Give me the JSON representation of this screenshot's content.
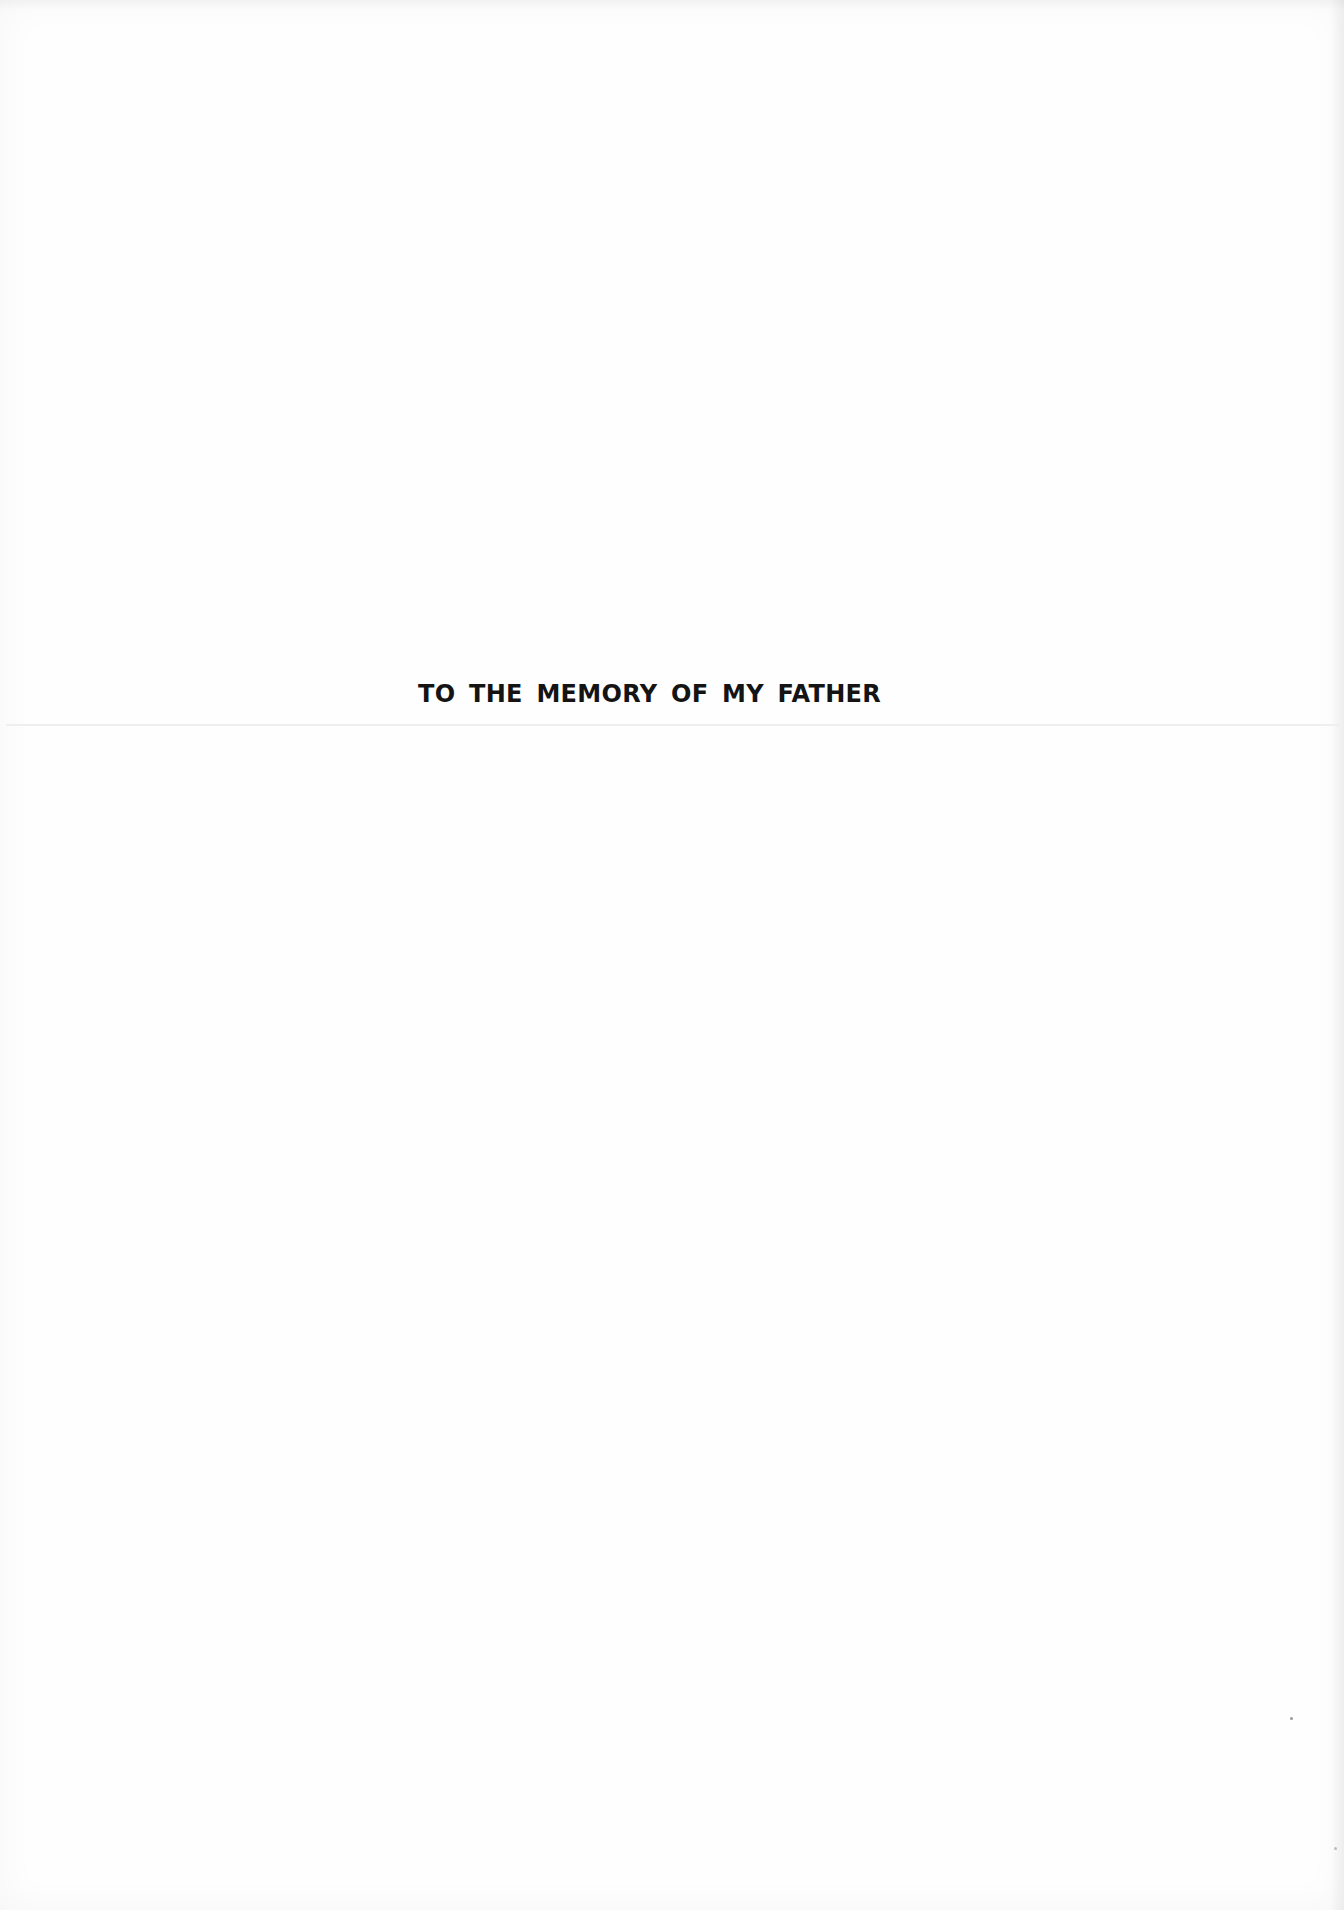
{
  "page": {
    "type": "dedication-page",
    "dedication_text": "TO THE MEMORY OF MY FATHER",
    "colors": {
      "background": "#fefefe",
      "text": "#141414",
      "rule": "#efefef"
    }
  }
}
